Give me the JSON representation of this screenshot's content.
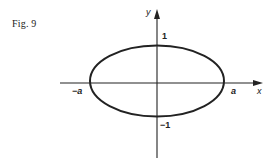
{
  "figure": {
    "label": "Fig. 9",
    "axes": {
      "x_label": "x",
      "y_label": "y"
    },
    "ticks": {
      "x_neg": "−a",
      "x_pos": "a",
      "y_pos": "1",
      "y_neg": "−1"
    },
    "curve": {
      "type": "ellipse",
      "equation_hint": "x^2/a^2 + y^2 = 1",
      "semi_axis_x": "a",
      "semi_axis_y": "1"
    },
    "colors": {
      "ink": "#222222",
      "background": "#ffffff"
    }
  }
}
